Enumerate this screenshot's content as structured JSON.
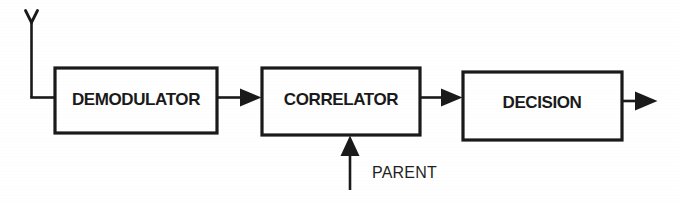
{
  "diagram": {
    "type": "block-diagram",
    "background_color": "#ffffff",
    "ink_color": "#1a1a1a",
    "width": 679,
    "height": 202,
    "input": {
      "label": "Y",
      "icon": "antenna-icon"
    },
    "blocks": [
      {
        "id": "demodulator",
        "label": "DEMODULATOR",
        "x": 55,
        "y": 68,
        "w": 162,
        "h": 65
      },
      {
        "id": "correlator",
        "label": "CORRELATOR",
        "x": 262,
        "y": 68,
        "w": 158,
        "h": 67
      },
      {
        "id": "decision",
        "label": "DECISION",
        "x": 463,
        "y": 72,
        "w": 159,
        "h": 68
      }
    ],
    "signals": [
      {
        "id": "parent",
        "label": "PARENT",
        "direction": "up",
        "target": "correlator"
      }
    ],
    "connections": [
      {
        "from": "input",
        "to": "demodulator",
        "arrow": false
      },
      {
        "from": "demodulator",
        "to": "correlator",
        "arrow": true
      },
      {
        "from": "correlator",
        "to": "decision",
        "arrow": true
      },
      {
        "from": "decision",
        "to": "output",
        "arrow": true
      },
      {
        "from": "parent",
        "to": "correlator",
        "arrow": true
      }
    ]
  }
}
